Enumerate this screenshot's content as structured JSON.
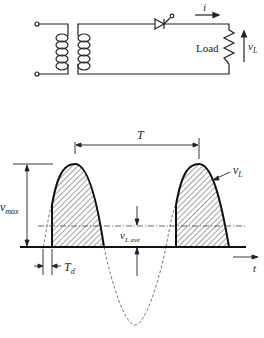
{
  "circuit": {
    "load_label": "Load",
    "current_label": "i",
    "voltage_label": "v",
    "voltage_sub": "L",
    "components": [
      "transformer",
      "scr-thyristor",
      "resistor-load"
    ]
  },
  "waveform": {
    "period_label": "T",
    "vmax_label": "v",
    "vmax_sub": "max",
    "vl_label": "v",
    "vl_sub": "L",
    "vlave_label": "v",
    "vlave_sub": "L ave",
    "delay_label": "T",
    "delay_sub": "d",
    "time_label": "t"
  },
  "colors": {
    "ink": "#222222",
    "hatch": "#444444"
  }
}
